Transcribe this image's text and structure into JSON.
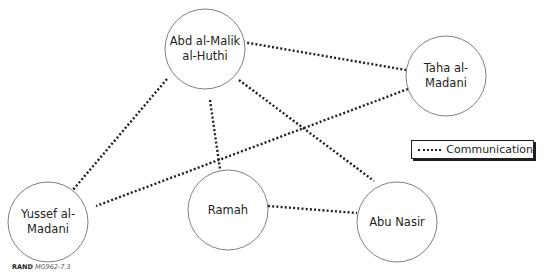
{
  "diagram": {
    "nodes": [
      {
        "id": "abd",
        "label": "Abd al-Malik\nal-Huthi",
        "cx": 205,
        "cy": 49,
        "r": 40
      },
      {
        "id": "taha",
        "label": "Taha al-\nMadani",
        "cx": 446,
        "cy": 76,
        "r": 40
      },
      {
        "id": "yussef",
        "label": "Yussef al-\nMadani",
        "cx": 48,
        "cy": 222,
        "r": 40
      },
      {
        "id": "ramah",
        "label": "Ramah",
        "cx": 228,
        "cy": 210,
        "r": 40
      },
      {
        "id": "abunasir",
        "label": "Abu Nasir",
        "cx": 397,
        "cy": 222,
        "r": 40
      }
    ],
    "edges": [
      {
        "from": "abd",
        "to": "taha",
        "type": "communication",
        "x1": 243,
        "y1": 42,
        "x2": 406,
        "y2": 70
      },
      {
        "from": "abd",
        "to": "yussef",
        "type": "communication",
        "x1": 167,
        "y1": 79,
        "x2": 72,
        "y2": 191
      },
      {
        "from": "abd",
        "to": "ramah",
        "type": "communication",
        "x1": 210,
        "y1": 100,
        "x2": 220,
        "y2": 169
      },
      {
        "from": "abd",
        "to": "abunasir",
        "type": "communication",
        "x1": 239,
        "y1": 80,
        "x2": 374,
        "y2": 181
      },
      {
        "from": "taha",
        "to": "yussef",
        "type": "communication",
        "x1": 408,
        "y1": 89,
        "x2": 96,
        "y2": 206
      },
      {
        "from": "ramah",
        "to": "abunasir",
        "type": "communication",
        "x1": 268,
        "y1": 206,
        "x2": 357,
        "y2": 213
      }
    ],
    "legend": {
      "label": "Communication",
      "line_style": "dotted"
    },
    "credit": {
      "org": "RAND",
      "ref": "MG962-7.3"
    },
    "colors": {
      "stroke": "#231f20",
      "node_border": "#808080",
      "background": "#ffffff"
    }
  }
}
